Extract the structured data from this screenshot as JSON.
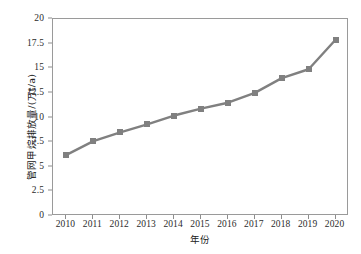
{
  "chart_data": {
    "type": "line",
    "title": "",
    "xlabel": "年份",
    "ylabel": "管网甲烷排放量/(万t/a)",
    "categories": [
      "2010",
      "2011",
      "2012",
      "2013",
      "2014",
      "2015",
      "2016",
      "2017",
      "2018",
      "2019",
      "2020"
    ],
    "values": [
      6.2,
      7.6,
      8.5,
      9.3,
      10.2,
      10.9,
      11.5,
      12.5,
      14.0,
      14.9,
      17.9
    ],
    "series": [
      {
        "name": "管网甲烷排放量",
        "values": [
          6.2,
          7.6,
          8.5,
          9.3,
          10.2,
          10.9,
          11.5,
          12.5,
          14.0,
          14.9,
          17.9
        ]
      }
    ],
    "ylim": [
      0,
      20
    ],
    "yticks": [
      "0",
      "2.5",
      "5",
      "7.5",
      "10",
      "12.5",
      "15",
      "17.5",
      "20"
    ],
    "ytick_values": [
      0,
      2.5,
      5,
      7.5,
      10,
      12.5,
      15,
      17.5,
      20
    ],
    "xticks": [
      "2010",
      "2011",
      "2012",
      "2013",
      "2014",
      "2015",
      "2016",
      "2017",
      "2018",
      "2019",
      "2020"
    ],
    "grid": false,
    "legend": "none",
    "line_color": "#808080",
    "marker": "square",
    "marker_color": "#808080",
    "frame_color": "#9a9a9a"
  }
}
